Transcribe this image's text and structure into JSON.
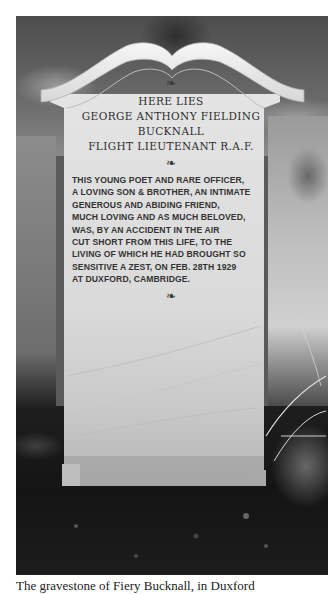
{
  "photo": {
    "subject": "gravestone",
    "inscription": {
      "ornament_top": "❧",
      "header_lines": [
        "HERE LIES",
        "GEORGE ANTHONY FIELDING",
        "BUCKNALL",
        "FLIGHT LIEUTENANT R.A.F."
      ],
      "ornament_middle": "❧",
      "epitaph_lines": [
        "THIS YOUNG POET AND RARE OFFICER,",
        "A LOVING SON & BROTHER, AN INTIMATE",
        "GENEROUS AND ABIDING FRIEND,",
        "MUCH LOVING AND AS MUCH BELOVED,",
        "WAS, BY AN ACCIDENT IN THE AIR",
        "CUT SHORT FROM THIS LIFE, TO THE",
        "LIVING OF WHICH HE HAD BROUGHT SO",
        "SENSITIVE A ZEST, ON FEB. 28TH 1929",
        "AT DUXFORD, CAMBRIDGE."
      ],
      "ornament_bottom": "❧"
    }
  },
  "caption": {
    "text": "The gravestone of Fiery Bucknall, in Duxford"
  }
}
